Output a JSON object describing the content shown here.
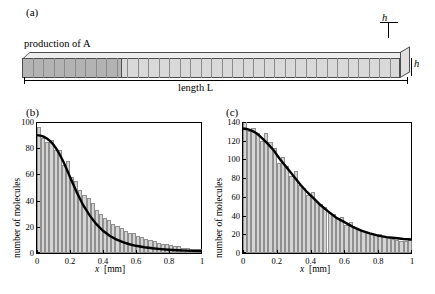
{
  "panels": {
    "a": {
      "label": "(a)",
      "production_label": "production of A",
      "length_label": "length L",
      "h_right": "h",
      "h_top": "h"
    },
    "b": {
      "label": "(b)"
    },
    "c": {
      "label": "(c)"
    }
  },
  "chart_data": [
    {
      "type": "bar",
      "panel": "(b)",
      "title": "time = 10 min",
      "legend": [
        "mean"
      ],
      "legend_position": "top-right",
      "xlabel": "x  [mm]",
      "ylabel": "number of molecules",
      "xlim": [
        0,
        1
      ],
      "ylim": [
        0,
        100
      ],
      "xticks": [
        0,
        0.2,
        0.4,
        0.6,
        0.8,
        1
      ],
      "yticks": [
        0,
        20,
        40,
        60,
        80,
        100
      ],
      "grid": false,
      "bin_width": 0.025,
      "x": [
        0.0125,
        0.0375,
        0.0625,
        0.0875,
        0.1125,
        0.1375,
        0.1625,
        0.1875,
        0.2125,
        0.2375,
        0.2625,
        0.2875,
        0.3125,
        0.3375,
        0.3625,
        0.3875,
        0.4125,
        0.4375,
        0.4625,
        0.4875,
        0.5125,
        0.5375,
        0.5625,
        0.5875,
        0.6125,
        0.6375,
        0.6625,
        0.6875,
        0.7125,
        0.7375,
        0.7625,
        0.7875,
        0.8125,
        0.8375,
        0.8625,
        0.8875,
        0.9125,
        0.9375,
        0.9625,
        0.9875
      ],
      "values": [
        96,
        88,
        85,
        86,
        79,
        79,
        67,
        70,
        58,
        55,
        48,
        44,
        42,
        38,
        33,
        30,
        27,
        25,
        22,
        21,
        19,
        17,
        15,
        15,
        13,
        12,
        11,
        10,
        9,
        8,
        7,
        7,
        6,
        5,
        5,
        4,
        4,
        3,
        3,
        3
      ],
      "series": [
        {
          "name": "mean",
          "type": "line",
          "color": "#000000",
          "x": [
            0.0,
            0.02,
            0.04,
            0.06,
            0.08,
            0.1,
            0.12,
            0.14,
            0.16,
            0.18,
            0.2,
            0.24,
            0.28,
            0.32,
            0.36,
            0.4,
            0.44,
            0.48,
            0.52,
            0.56,
            0.6,
            0.65,
            0.7,
            0.75,
            0.8,
            0.85,
            0.9,
            0.95,
            1.0
          ],
          "values": [
            90,
            89.6,
            88.8,
            87.4,
            85.4,
            82.6,
            79,
            74.6,
            69.6,
            64,
            58,
            46.5,
            36.5,
            28.5,
            22,
            17,
            13.2,
            10.4,
            8.3,
            6.7,
            5.5,
            4.4,
            3.6,
            3.0,
            2.5,
            2.1,
            1.8,
            1.6,
            1.5
          ]
        }
      ]
    },
    {
      "type": "bar",
      "panel": "(c)",
      "title": "time = 30 min",
      "legend": [
        "mean"
      ],
      "legend_position": "top-right",
      "xlabel": "x  [mm]",
      "ylabel": "number of molecules",
      "xlim": [
        0,
        1
      ],
      "ylim": [
        0,
        140
      ],
      "xticks": [
        0,
        0.2,
        0.4,
        0.6,
        0.8,
        1
      ],
      "yticks": [
        0,
        20,
        40,
        60,
        80,
        100,
        120,
        140
      ],
      "grid": false,
      "bin_width": 0.025,
      "x": [
        0.0125,
        0.0375,
        0.0625,
        0.0875,
        0.1125,
        0.1375,
        0.1625,
        0.1875,
        0.2125,
        0.2375,
        0.2625,
        0.2875,
        0.3125,
        0.3375,
        0.3625,
        0.3875,
        0.4125,
        0.4375,
        0.4625,
        0.4875,
        0.5125,
        0.5375,
        0.5625,
        0.5875,
        0.6125,
        0.6375,
        0.6625,
        0.6875,
        0.7125,
        0.7375,
        0.7625,
        0.7875,
        0.8125,
        0.8375,
        0.8625,
        0.8875,
        0.9125,
        0.9375,
        0.9625,
        0.9875
      ],
      "values": [
        140,
        130,
        134,
        128,
        120,
        128,
        119,
        112,
        96,
        103,
        93,
        82,
        88,
        73,
        70,
        62,
        65,
        55,
        52,
        49,
        43,
        42,
        36,
        38,
        30,
        33,
        27,
        26,
        24,
        22,
        21,
        19,
        20,
        17,
        16,
        15,
        14,
        13,
        13,
        14
      ],
      "series": [
        {
          "name": "mean",
          "type": "line",
          "color": "#000000",
          "x": [
            0.0,
            0.02,
            0.04,
            0.06,
            0.08,
            0.1,
            0.14,
            0.18,
            0.22,
            0.26,
            0.3,
            0.34,
            0.38,
            0.42,
            0.46,
            0.5,
            0.55,
            0.6,
            0.65,
            0.7,
            0.75,
            0.8,
            0.85,
            0.9,
            0.95,
            1.0
          ],
          "values": [
            133,
            132.5,
            131.5,
            130,
            128,
            125,
            118,
            110,
            100,
            91,
            82,
            73,
            65,
            58,
            51,
            45,
            38,
            33,
            28,
            24,
            21,
            18.5,
            17,
            16,
            15,
            14.5
          ]
        }
      ]
    }
  ]
}
